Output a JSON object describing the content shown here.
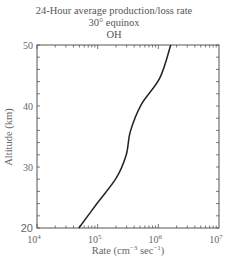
{
  "chart": {
    "title_line1": "24-Hour average production/loss rate",
    "title_line2": "30° equinox",
    "title_line3": "OH",
    "xlabel": "Rate (cm⁻³ sec⁻¹)",
    "ylabel": "Altitude (km)"
  },
  "chart_data": {
    "type": "line",
    "xlabel": "Rate (cm^-3 sec^-1)",
    "ylabel": "Altitude (km)",
    "xscale": "log",
    "xlim": [
      10000,
      10000000
    ],
    "ylim": [
      20,
      50
    ],
    "x_ticks": [
      "10^4",
      "10^5",
      "10^6",
      "10^7"
    ],
    "y_ticks": [
      20,
      30,
      40,
      50
    ],
    "grid": false,
    "series": [
      {
        "name": "OH",
        "points": [
          {
            "altitude": 20,
            "rate": 49000
          },
          {
            "altitude": 23.8,
            "rate": 94000
          },
          {
            "altitude": 28.2,
            "rate": 203000
          },
          {
            "altitude": 32,
            "rate": 296000
          },
          {
            "altitude": 35.8,
            "rate": 345000
          },
          {
            "altitude": 40.2,
            "rate": 520000
          },
          {
            "altitude": 44.6,
            "rate": 1060000
          },
          {
            "altitude": 50,
            "rate": 1600000
          }
        ]
      }
    ]
  }
}
